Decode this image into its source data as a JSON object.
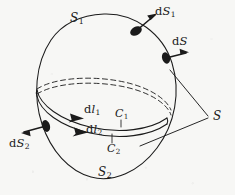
{
  "figure": {
    "kind": "geometry-diagram",
    "stroke_color": "#1b1b1b",
    "background_color": "#f7f7f5"
  },
  "labels": {
    "s1": {
      "text": "S",
      "sub": "1"
    },
    "s2": {
      "text": "S",
      "sub": "2"
    },
    "s": {
      "text": "S",
      "sub": ""
    },
    "dS1": {
      "prefix": "d",
      "text": "S",
      "sub": "1"
    },
    "dS": {
      "prefix": "d",
      "text": "S",
      "sub": ""
    },
    "dS2": {
      "prefix": "d",
      "text": "S",
      "sub": "2"
    },
    "dl1": {
      "prefix": "d",
      "text": "l",
      "sub": "1"
    },
    "dl2": {
      "prefix": "d",
      "text": "l",
      "sub": "2"
    },
    "c1": {
      "text": "C",
      "sub": "1"
    },
    "c2": {
      "text": "C",
      "sub": "2"
    }
  },
  "elements": {
    "outer_surface": "tilted-ellipse-outline",
    "hidden_contour": "dashed-back-arc",
    "visible_contour": "solid-front-band",
    "normal_markers": [
      "dS1",
      "dS",
      "dS2"
    ],
    "leader_wedge": "two-lines-converging-to-S"
  }
}
